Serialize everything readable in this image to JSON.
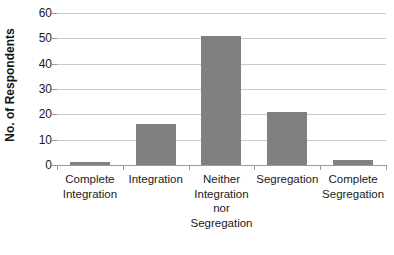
{
  "chart_data": {
    "type": "bar",
    "title": "",
    "xlabel": "",
    "ylabel": "No. of Respondents",
    "categories": [
      "Complete\nIntegration",
      "Integration",
      "Neither\nIntegration\nnor\nSegregation",
      "Segregation",
      "Complete\nSegregation"
    ],
    "values": [
      1,
      16,
      51,
      21,
      2
    ],
    "ylim": [
      0,
      60
    ],
    "ytick_step": 10,
    "yticks": [
      60,
      50,
      40,
      30,
      20,
      10,
      0
    ],
    "ytick_labels": [
      "60",
      "50",
      "40",
      "30",
      "20",
      "10",
      "0"
    ],
    "grid": true,
    "grid_axis": "y",
    "legend": false,
    "legend_position": "none",
    "bar_color": "#808080",
    "gridline_color": "#c9c9c9",
    "axis_color": "#9a9a9a",
    "background_color": "#ffffff",
    "text_color": "#1a1a1a"
  }
}
